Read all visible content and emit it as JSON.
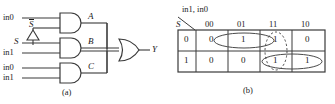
{
  "figure": {
    "panel_a": {
      "caption": "(a)",
      "gate_top": {
        "type": "and-gate",
        "inputs": [
          "in0",
          "S"
        ],
        "input_2_overbar": true,
        "output_label": "A"
      },
      "gate_middle": {
        "type": "and-gate",
        "inputs": [
          "S",
          "in1"
        ],
        "output_label": "B"
      },
      "gate_bottom": {
        "type": "and-gate",
        "inputs": [
          "in0",
          "in1"
        ],
        "output_label": "C"
      },
      "inverter": {
        "type": "inverter-triangle",
        "input": "S",
        "output": "S"
      },
      "gate_or": {
        "type": "or-gate",
        "output_label": "Y"
      }
    },
    "panel_b": {
      "caption": "(b)",
      "col_header_title": "in1, in0",
      "row_header_title": "S",
      "col_headers": [
        "00",
        "01",
        "11",
        "10"
      ],
      "row_headers": [
        "0",
        "1"
      ],
      "cells": [
        [
          "0",
          "1",
          "1",
          "0"
        ],
        [
          "0",
          "0",
          "1",
          "1"
        ]
      ],
      "groupings": [
        {
          "name": "group-row0-solid",
          "style": "solid",
          "cells": "row0 cols 01,11"
        },
        {
          "name": "group-col11-dotted",
          "style": "dotted",
          "cells": "col 11 rows 0,1"
        },
        {
          "name": "group-row1-solid",
          "style": "solid",
          "cells": "row1 cols 11,10"
        }
      ]
    }
  },
  "colors": {
    "ink": "#1a1a1a",
    "line": "#3a3a3a",
    "group": "#4a4a4a"
  }
}
